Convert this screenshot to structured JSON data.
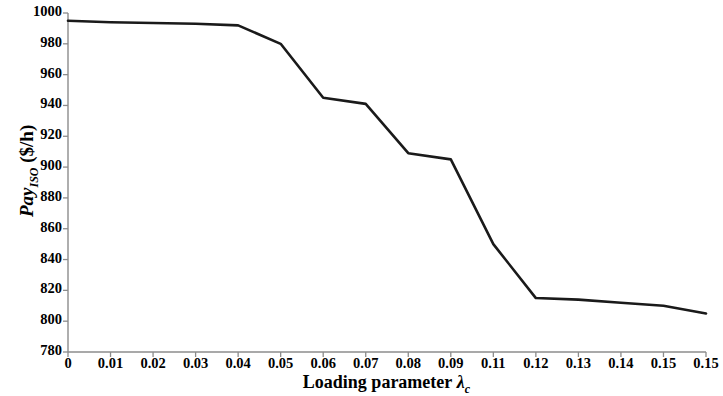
{
  "chart_data": {
    "type": "line",
    "title": "",
    "xlabel": "Loading parameter λc",
    "xlabel_main": "Loading parameter",
    "xlabel_symbol": "λ",
    "xlabel_symbol_sub": "c",
    "ylabel": "Pay_ISO ($/h)",
    "ylabel_main": "Pay",
    "ylabel_sub": "ISO",
    "ylabel_unit": " ($/h)",
    "x": [
      0,
      0.01,
      0.02,
      0.03,
      0.04,
      0.05,
      0.06,
      0.07,
      0.08,
      0.09,
      0.1,
      0.11,
      0.12,
      0.13,
      0.14,
      0.15
    ],
    "values": [
      995,
      994,
      993.5,
      993,
      992,
      980,
      945,
      941,
      909,
      905,
      850,
      815,
      814,
      812,
      810,
      805
    ],
    "series": [
      {
        "name": "Pay_ISO",
        "values": [
          995,
          994,
          993.5,
          993,
          992,
          980,
          945,
          941,
          909,
          905,
          850,
          815,
          814,
          812,
          810,
          805
        ]
      }
    ],
    "xlim": [
      0,
      0.15
    ],
    "ylim": [
      780,
      1000
    ],
    "ytick_labels": [
      "1000",
      "980",
      "960",
      "940",
      "920",
      "900",
      "880",
      "860",
      "840",
      "820",
      "800",
      "780"
    ],
    "ytick_values": [
      1000,
      980,
      960,
      940,
      920,
      900,
      880,
      860,
      840,
      820,
      800,
      780
    ],
    "xtick_labels": [
      "0",
      "0.01",
      "0.02",
      "0.03",
      "0.04",
      "0.05",
      "0.06",
      "0.07",
      "0.08",
      "0.09",
      "0.11",
      "0.12",
      "0.13",
      "0.14",
      "0.15"
    ],
    "xtick_values": [
      0,
      0.01,
      0.02,
      0.03,
      0.04,
      0.05,
      0.06,
      0.07,
      0.08,
      0.09,
      0.1,
      0.11,
      0.12,
      0.13,
      0.14
    ],
    "line_color": "#1a1a1a",
    "axis_color": "#808080",
    "grid": false,
    "legend": null
  }
}
